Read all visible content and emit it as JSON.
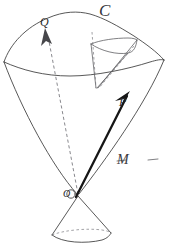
{
  "figure": {
    "background_color": "#ffffff",
    "ink_color": "#2b2b2b",
    "bold_ink_color": "#161616",
    "dashed_ink_color": "#6a6a70",
    "width": 170,
    "height": 246
  },
  "labels": {
    "vector_q": "Q",
    "curve_c": "C",
    "vector_p": "P",
    "origin": "O",
    "manifold": "—M—"
  },
  "elements": {
    "outer_cone_name": "outer-cone",
    "inner_cone_name": "inner-cone",
    "lower_cone_name": "lower-cone",
    "vector_q_name": "vector-q-arrow",
    "vector_p_name": "vector-p-arrow"
  },
  "geometry": {
    "apex": [
      78,
      195
    ],
    "outer_rim_left": [
      4,
      62
    ],
    "outer_rim_right": [
      164,
      60
    ],
    "outer_rim_top_peak": [
      86,
      14
    ],
    "q_arrow_tip": [
      45,
      30
    ],
    "q_arrow_tail": [
      78,
      195
    ],
    "p_arrow_tip": [
      129,
      93
    ],
    "p_arrow_tail": [
      78,
      195
    ],
    "inner_cone_apex": [
      97,
      88
    ],
    "inner_cone_rim_left": [
      91,
      44
    ],
    "inner_cone_rim_right": [
      137,
      40
    ],
    "lower_cone_apex": [
      78,
      195
    ],
    "lower_cone_base_left": [
      52,
      236
    ],
    "lower_cone_base_right": [
      111,
      234
    ]
  }
}
